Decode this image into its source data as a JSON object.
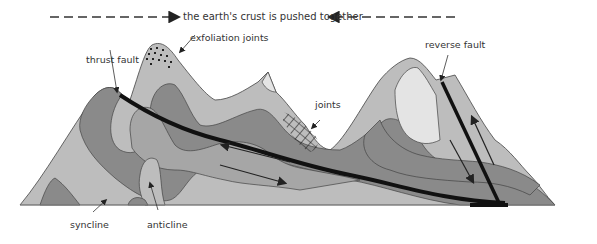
{
  "title": {
    "text": "the earth's crust is pushed together",
    "left_arrow": "arrow-right-dashed",
    "right_arrow": "arrow-left-dashed"
  },
  "labels": {
    "exfoliation_joints": "exfoliation joints",
    "thrust_fault": "thrust fault",
    "joints": "joints",
    "reverse_fault": "reverse fault",
    "syncline": "syncline",
    "anticline": "anticline"
  },
  "colors": {
    "background": "#ffffff",
    "layer_lightest": "#e4e4e4",
    "layer_light": "#bdbdbd",
    "layer_mid": "#a6a6a6",
    "layer_dark": "#8a8a8a",
    "fault_line": "#111111",
    "text": "#333333"
  }
}
